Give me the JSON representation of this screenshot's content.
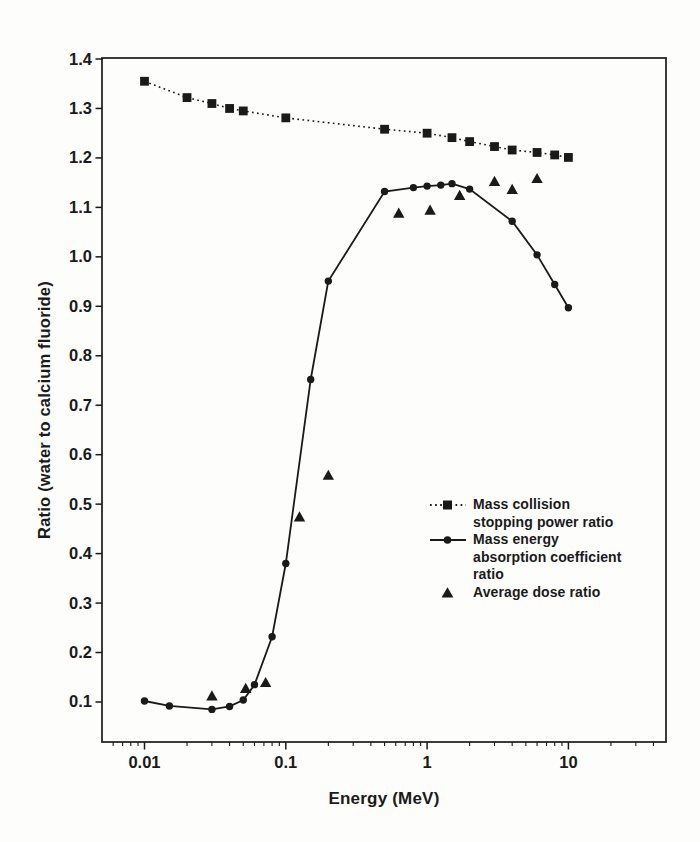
{
  "page": {
    "background": "#fdfdfb",
    "ink": "#1a1a1a"
  },
  "chart_data": {
    "type": "line",
    "title": "",
    "xlabel": "Energy (MeV)",
    "ylabel": "Ratio (water to calcium fluoride)",
    "x_scale": "log",
    "xlim": [
      0.005,
      50
    ],
    "ylim": [
      0.02,
      1.4
    ],
    "grid": false,
    "x_ticks": {
      "values": [
        0.01,
        0.1,
        1,
        10
      ],
      "labels": [
        "0.01",
        "0.1",
        "1",
        "10"
      ]
    },
    "y_ticks": {
      "values": [
        0.1,
        0.2,
        0.3,
        0.4,
        0.5,
        0.6,
        0.7,
        0.8,
        0.9,
        1.0,
        1.1,
        1.2,
        1.3,
        1.4
      ],
      "labels": [
        "0.1",
        "0.2",
        "0.3",
        "0.4",
        "0.5",
        "0.6",
        "0.7",
        "0.8",
        "0.9",
        "1.0",
        "1.1",
        "1.2",
        "1.3",
        "1.4"
      ]
    },
    "series": [
      {
        "name": "Mass collision stopping power ratio",
        "marker": "square",
        "line_style": "dotted",
        "points": [
          [
            0.01,
            1.355
          ],
          [
            0.02,
            1.322
          ],
          [
            0.03,
            1.31
          ],
          [
            0.04,
            1.3
          ],
          [
            0.05,
            1.295
          ],
          [
            0.1,
            1.281
          ],
          [
            0.5,
            1.258
          ],
          [
            1,
            1.25
          ],
          [
            1.5,
            1.241
          ],
          [
            2,
            1.233
          ],
          [
            3,
            1.223
          ],
          [
            4,
            1.216
          ],
          [
            6,
            1.211
          ],
          [
            8,
            1.206
          ],
          [
            10,
            1.201
          ]
        ]
      },
      {
        "name": "Mass energy absorption coefficient ratio",
        "marker": "circle",
        "line_style": "solid",
        "points": [
          [
            0.01,
            0.102
          ],
          [
            0.015,
            0.092
          ],
          [
            0.03,
            0.085
          ],
          [
            0.04,
            0.091
          ],
          [
            0.05,
            0.104
          ],
          [
            0.06,
            0.135
          ],
          [
            0.08,
            0.232
          ],
          [
            0.1,
            0.38
          ],
          [
            0.15,
            0.752
          ],
          [
            0.2,
            0.951
          ],
          [
            0.5,
            1.132
          ],
          [
            0.8,
            1.14
          ],
          [
            1,
            1.143
          ],
          [
            1.25,
            1.145
          ],
          [
            1.5,
            1.148
          ],
          [
            2,
            1.137
          ],
          [
            4,
            1.072
          ],
          [
            6,
            1.004
          ],
          [
            8,
            0.944
          ],
          [
            10,
            0.897
          ]
        ]
      },
      {
        "name": "Average dose ratio",
        "marker": "triangle",
        "line_style": "none",
        "points": [
          [
            0.03,
            0.112
          ],
          [
            0.052,
            0.127
          ],
          [
            0.072,
            0.139
          ],
          [
            0.125,
            0.474
          ],
          [
            0.2,
            0.558
          ],
          [
            0.63,
            1.088
          ],
          [
            1.05,
            1.094
          ],
          [
            1.7,
            1.124
          ],
          [
            3,
            1.152
          ],
          [
            4,
            1.136
          ],
          [
            6,
            1.158
          ]
        ]
      }
    ],
    "legend": {
      "position": "lower-right-inside",
      "entries": [
        {
          "marker": "square-dotted",
          "label": "Mass collision\nstopping power ratio"
        },
        {
          "marker": "circle-solid",
          "label": "Mass energy\nabsorption coefficient\nratio"
        },
        {
          "marker": "triangle",
          "label": "Average dose ratio"
        }
      ]
    }
  }
}
